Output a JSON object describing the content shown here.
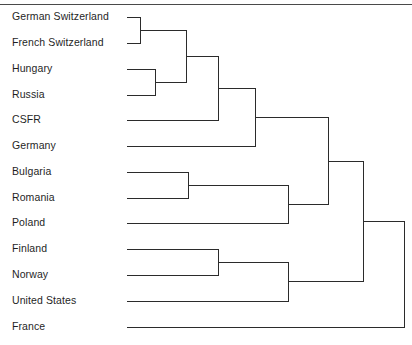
{
  "figure": {
    "title": "",
    "top_rule": true
  },
  "chart_data": {
    "type": "dendrogram",
    "title": "",
    "xlabel": "",
    "ylabel": "",
    "orientation": "horizontal",
    "leaf_order": [
      "German Switzerland",
      "French Switzerland",
      "Hungary",
      "Russia",
      "CSFR",
      "Germany",
      "Bulgaria",
      "Romania",
      "Poland",
      "Finland",
      "Norway",
      "United States",
      "France"
    ],
    "leaves": [
      {
        "label": "German Switzerland",
        "index": 0,
        "y": 17
      },
      {
        "label": "French Switzerland",
        "index": 1,
        "y": 43
      },
      {
        "label": "Hungary",
        "index": 2,
        "y": 69
      },
      {
        "label": "Russia",
        "index": 3,
        "y": 95
      },
      {
        "label": "CSFR",
        "index": 4,
        "y": 120
      },
      {
        "label": "Germany",
        "index": 5,
        "y": 146
      },
      {
        "label": "Bulgaria",
        "index": 6,
        "y": 172
      },
      {
        "label": "Romania",
        "index": 7,
        "y": 198
      },
      {
        "label": "Poland",
        "index": 8,
        "y": 223
      },
      {
        "label": "Finland",
        "index": 9,
        "y": 249
      },
      {
        "label": "Norway",
        "index": 10,
        "y": 275
      },
      {
        "label": "United States",
        "index": 11,
        "y": 301
      },
      {
        "label": "France",
        "index": 12,
        "y": 327
      }
    ],
    "leaf_start_x": 126,
    "axis_ranges": {
      "x": [
        126,
        405
      ],
      "y": [
        10,
        334
      ]
    },
    "grid": false,
    "legend": "none",
    "merges": [
      {
        "id": "m1",
        "label": "German Switzerland + French Switzerland",
        "x": 140,
        "members": [
          "German Switzerland",
          "French Switzerland"
        ],
        "child_y": [
          17,
          43
        ],
        "y": 30
      },
      {
        "id": "m2",
        "label": "Hungary + Russia",
        "x": 155,
        "members": [
          "Hungary",
          "Russia"
        ],
        "child_y": [
          69,
          95
        ],
        "y": 82
      },
      {
        "id": "m3",
        "label": "Swiss cluster + Hungary/Russia",
        "x": 186,
        "members": [
          "m1",
          "m2"
        ],
        "child_y": [
          30,
          82
        ],
        "y": 56
      },
      {
        "id": "m4",
        "label": "Central cluster + CSFR",
        "x": 218,
        "members": [
          "m3",
          "CSFR"
        ],
        "child_y": [
          56,
          120
        ],
        "y": 88
      },
      {
        "id": "m5",
        "label": "Central cluster + Germany",
        "x": 255,
        "members": [
          "m4",
          "Germany"
        ],
        "child_y": [
          88,
          146
        ],
        "y": 117
      },
      {
        "id": "m6",
        "label": "Bulgaria + Romania",
        "x": 188,
        "members": [
          "Bulgaria",
          "Romania"
        ],
        "child_y": [
          172,
          198
        ],
        "y": 185
      },
      {
        "id": "m7",
        "label": "Bulgaria/Romania + Poland",
        "x": 288,
        "members": [
          "m6",
          "Poland"
        ],
        "child_y": [
          185,
          223
        ],
        "y": 204
      },
      {
        "id": "m8",
        "label": "European supercluster",
        "x": 328,
        "members": [
          "m5",
          "m7"
        ],
        "child_y": [
          117,
          204
        ],
        "y": 161
      },
      {
        "id": "m9",
        "label": "Finland + Norway",
        "x": 218,
        "members": [
          "Finland",
          "Norway"
        ],
        "child_y": [
          249,
          275
        ],
        "y": 262
      },
      {
        "id": "m10",
        "label": "Finland/Norway + United States",
        "x": 288,
        "members": [
          "m9",
          "United States"
        ],
        "child_y": [
          262,
          301
        ],
        "y": 281
      },
      {
        "id": "m11",
        "label": "European supercluster + Nordic/US cluster",
        "x": 363,
        "members": [
          "m8",
          "m10"
        ],
        "child_y": [
          161,
          281
        ],
        "y": 221
      },
      {
        "id": "m12",
        "label": "Root: all clusters + France",
        "x": 404,
        "members": [
          "m11",
          "France"
        ],
        "child_y": [
          221,
          327
        ],
        "y": 274
      }
    ]
  }
}
